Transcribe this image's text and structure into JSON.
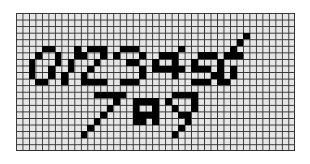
{
  "canvas": {
    "title": "",
    "cols": 43,
    "rows": 21,
    "cell_w": 6.49,
    "cell_h": 6.57,
    "colors": {
      "empty": "#e6e6e6",
      "filled": "#000000",
      "gridline": "#333333"
    }
  },
  "digits_drawn": [
    "0",
    "1",
    "2",
    "3",
    "4",
    "5",
    "6",
    "7",
    "8",
    "9"
  ],
  "filled_cells": [
    [
      4,
      5
    ],
    [
      5,
      5
    ],
    [
      3,
      6
    ],
    [
      6,
      6
    ],
    [
      2,
      7
    ],
    [
      6,
      7
    ],
    [
      2,
      8
    ],
    [
      5,
      8
    ],
    [
      2,
      9
    ],
    [
      5,
      9
    ],
    [
      3,
      10
    ],
    [
      4,
      10
    ],
    [
      9,
      5
    ],
    [
      9,
      6
    ],
    [
      8,
      7
    ],
    [
      8,
      8
    ],
    [
      7,
      9
    ],
    [
      7,
      10
    ],
    [
      11,
      5
    ],
    [
      12,
      5
    ],
    [
      13,
      5
    ],
    [
      10,
      6
    ],
    [
      13,
      6
    ],
    [
      12,
      7
    ],
    [
      11,
      8
    ],
    [
      10,
      9
    ],
    [
      10,
      10
    ],
    [
      11,
      10
    ],
    [
      12,
      10
    ],
    [
      13,
      10
    ],
    [
      16,
      5
    ],
    [
      17,
      5
    ],
    [
      18,
      5
    ],
    [
      15,
      6
    ],
    [
      19,
      6
    ],
    [
      17,
      7
    ],
    [
      18,
      7
    ],
    [
      19,
      8
    ],
    [
      19,
      9
    ],
    [
      16,
      10
    ],
    [
      17,
      10
    ],
    [
      18,
      10
    ],
    [
      22,
      6
    ],
    [
      23,
      6
    ],
    [
      24,
      6
    ],
    [
      25,
      5
    ],
    [
      21,
      7
    ],
    [
      24,
      7
    ],
    [
      21,
      8
    ],
    [
      22,
      8
    ],
    [
      23,
      8
    ],
    [
      24,
      8
    ],
    [
      25,
      8
    ],
    [
      24,
      9
    ],
    [
      28,
      6
    ],
    [
      29,
      6
    ],
    [
      30,
      6
    ],
    [
      27,
      7
    ],
    [
      27,
      8
    ],
    [
      28,
      8
    ],
    [
      29,
      8
    ],
    [
      30,
      9
    ],
    [
      27,
      10
    ],
    [
      28,
      10
    ],
    [
      29,
      10
    ],
    [
      35,
      3
    ],
    [
      34,
      4
    ],
    [
      33,
      5
    ],
    [
      32,
      6
    ],
    [
      33,
      6
    ],
    [
      34,
      6
    ],
    [
      31,
      7
    ],
    [
      31,
      8
    ],
    [
      33,
      8
    ],
    [
      31,
      9
    ],
    [
      33,
      9
    ],
    [
      31,
      10
    ],
    [
      32,
      10
    ],
    [
      12,
      12
    ],
    [
      13,
      12
    ],
    [
      14,
      12
    ],
    [
      15,
      12
    ],
    [
      16,
      12
    ],
    [
      15,
      13
    ],
    [
      14,
      14
    ],
    [
      13,
      15
    ],
    [
      12,
      16
    ],
    [
      11,
      17
    ],
    [
      10,
      18
    ],
    [
      18,
      13
    ],
    [
      19,
      13
    ],
    [
      20,
      13
    ],
    [
      21,
      13
    ],
    [
      18,
      14
    ],
    [
      21,
      14
    ],
    [
      18,
      15
    ],
    [
      19,
      15
    ],
    [
      20,
      15
    ],
    [
      21,
      15
    ],
    [
      18,
      16
    ],
    [
      21,
      16
    ],
    [
      19,
      16
    ],
    [
      24,
      12
    ],
    [
      25,
      12
    ],
    [
      26,
      12
    ],
    [
      27,
      12
    ],
    [
      23,
      13
    ],
    [
      27,
      13
    ],
    [
      24,
      14
    ],
    [
      27,
      14
    ],
    [
      25,
      15
    ],
    [
      26,
      15
    ],
    [
      26,
      16
    ],
    [
      25,
      17
    ],
    [
      24,
      18
    ]
  ]
}
